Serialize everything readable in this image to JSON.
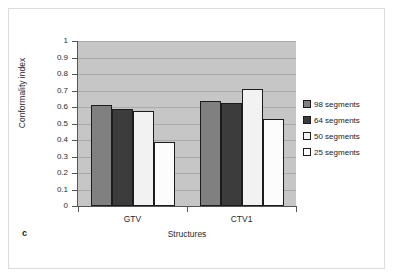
{
  "figure": {
    "panel_letter": "c",
    "frame_color": "#dcdcdc"
  },
  "chart_data": {
    "type": "bar",
    "title": "",
    "xlabel": "Structures",
    "ylabel": "Conformality index",
    "categories": [
      "GTV",
      "CTV1"
    ],
    "series": [
      {
        "name": "98 segments",
        "color": "#808080",
        "values": [
          0.61,
          0.635
        ]
      },
      {
        "name": "64 segments",
        "color": "#3c3c3c",
        "values": [
          0.59,
          0.625
        ]
      },
      {
        "name": "50 segments",
        "color": "#f2f2f2",
        "values": [
          0.575,
          0.71
        ]
      },
      {
        "name": "25 segments",
        "color": "#fcfcfc",
        "values": [
          0.385,
          0.525
        ]
      }
    ],
    "ylim": [
      0,
      1
    ],
    "ytick_labels": [
      "0",
      "0.1",
      "0.2",
      "0.3",
      "0.4",
      "0.5",
      "0.6",
      "0.7",
      "0.8",
      "0.9",
      "1"
    ],
    "ytick_values": [
      0,
      0.1,
      0.2,
      0.3,
      0.4,
      0.5,
      0.6,
      0.7,
      0.8,
      0.9,
      1
    ],
    "grid": true,
    "legend_position": "right",
    "plot_background": "#c6c6c6",
    "gridline_color": "#a9a9a9",
    "axis_color": "#555555",
    "bar_border_color": "#1c1c1c"
  }
}
